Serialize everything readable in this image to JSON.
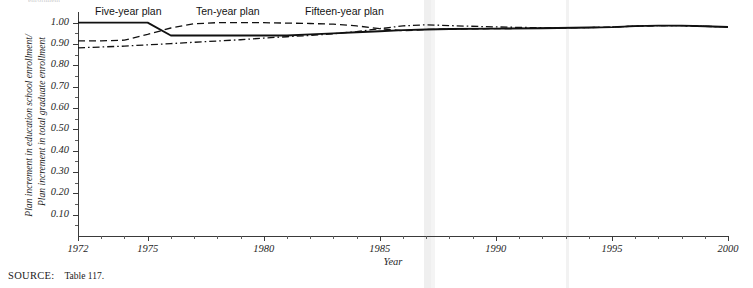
{
  "figure": {
    "caption_fragment": "enrollment",
    "source_keyword": "SOURCE:",
    "source_text": "Table 117."
  },
  "chart_data": {
    "type": "line",
    "title": "",
    "xlabel": "Year",
    "ylabel": "Plan increment in education school enrollment/ Plan increment in total graduate enrollment",
    "ylabel_line1": "Plan increment in education school enrollment/",
    "ylabel_line2": "Plan increment in total graduate enrollment",
    "xlim": [
      1972,
      2000
    ],
    "ylim": [
      0.0,
      1.05
    ],
    "grid": false,
    "legend_position": "above-plot-inline",
    "y_ticks": [
      1.0,
      0.9,
      0.8,
      0.7,
      0.6,
      0.5,
      0.4,
      0.3,
      0.2,
      0.1
    ],
    "y_tick_labels": [
      "1.00",
      "0.90",
      "0.80",
      "0.70",
      "0.60",
      "0.50",
      "0.40",
      "0.30",
      "0.20",
      "0.10"
    ],
    "y_minor_ticks": [
      0.95,
      0.85,
      0.75,
      0.65,
      0.55,
      0.45,
      0.35,
      0.25,
      0.15,
      0.05
    ],
    "x_ticks": [
      1972,
      1975,
      1980,
      1985,
      1990,
      1995,
      2000
    ],
    "x_tick_labels": [
      "1972",
      "1975",
      "1980",
      "1985",
      "1990",
      "1995",
      "2000"
    ],
    "x_minor_ticks": [
      1973,
      1974,
      1976,
      1977,
      1978,
      1979,
      1981,
      1982,
      1983,
      1984,
      1986,
      1987,
      1988,
      1989,
      1991,
      1992,
      1993,
      1994,
      1996,
      1997,
      1998,
      1999
    ],
    "series": [
      {
        "name": "Five-year plan",
        "style": "solid",
        "color": "#111111",
        "x": [
          1972,
          1973,
          1974,
          1975,
          1976,
          1977,
          1978,
          1979,
          1980,
          1981,
          1982,
          1983,
          1984,
          1985,
          1986,
          1987,
          1988,
          1990,
          1992,
          1994,
          1995,
          1996,
          1997,
          1998,
          1999,
          2000
        ],
        "y": [
          1.0,
          1.0,
          1.0,
          1.0,
          0.94,
          0.94,
          0.94,
          0.94,
          0.94,
          0.94,
          0.945,
          0.95,
          0.955,
          0.96,
          0.965,
          0.968,
          0.97,
          0.972,
          0.974,
          0.977,
          0.979,
          0.984,
          0.986,
          0.986,
          0.983,
          0.98
        ]
      },
      {
        "name": "Ten-year plan",
        "style": "dashed",
        "color": "#111111",
        "x": [
          1972,
          1973,
          1974,
          1975,
          1976,
          1977,
          1978,
          1979,
          1980,
          1981,
          1982,
          1983,
          1984,
          1985,
          1986,
          1987,
          1988,
          1990,
          1992,
          1994,
          1995,
          1996,
          1997,
          1998,
          1999,
          2000
        ],
        "y": [
          0.915,
          0.915,
          0.918,
          0.945,
          0.975,
          0.995,
          1.0,
          1.0,
          1.0,
          0.998,
          0.996,
          0.993,
          0.985,
          0.972,
          0.962,
          0.968,
          0.97,
          0.972,
          0.974,
          0.977,
          0.979,
          0.984,
          0.986,
          0.986,
          0.983,
          0.98
        ]
      },
      {
        "name": "Fifteen-year plan",
        "style": "dash-dot",
        "color": "#111111",
        "x": [
          1972,
          1973,
          1974,
          1975,
          1976,
          1977,
          1978,
          1979,
          1980,
          1981,
          1982,
          1983,
          1984,
          1985,
          1986,
          1987,
          1988,
          1990,
          1992,
          1994,
          1995,
          1996,
          1997,
          1998,
          1999,
          2000
        ],
        "y": [
          0.882,
          0.886,
          0.89,
          0.896,
          0.902,
          0.908,
          0.914,
          0.92,
          0.928,
          0.934,
          0.94,
          0.948,
          0.958,
          0.972,
          0.985,
          0.99,
          0.986,
          0.98,
          0.976,
          0.977,
          0.979,
          0.984,
          0.986,
          0.986,
          0.983,
          0.98
        ]
      }
    ],
    "legend_labels": [
      {
        "text": "Five-year plan",
        "x": 95,
        "y": 5
      },
      {
        "text": "Ten-year plan",
        "x": 196,
        "y": 5
      },
      {
        "text": "Fifteen-year plan",
        "x": 305,
        "y": 5
      }
    ]
  }
}
